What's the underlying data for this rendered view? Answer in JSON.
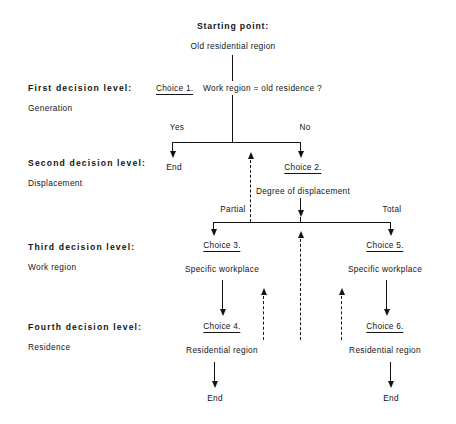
{
  "diagram": {
    "title_bold": "Starting  point:",
    "title_sub": "Old residential region",
    "levels": [
      {
        "title": "First decision level:",
        "sub": "Generation"
      },
      {
        "title": "Second decision level:",
        "sub": "Displacement"
      },
      {
        "title": "Third decision level:",
        "sub": "Work region"
      },
      {
        "title": "Fourth decision level:",
        "sub": "Residence"
      }
    ],
    "choices": {
      "c1_label": "Choice 1.",
      "c1_text": "Work region = old residence ?",
      "c2_label": "Choice 2.",
      "c2_text": "Degree of displacement",
      "c3_label": "Choice 3.",
      "c3_text": "Specific workplace",
      "c4_label": "Choice 4.",
      "c4_text": "Residential region",
      "c5_label": "Choice 5.",
      "c5_text": "Specific workplace",
      "c6_label": "Choice 6.",
      "c6_text": "Residential region"
    },
    "edges": {
      "yes": "Yes",
      "no": "No",
      "partial": "Partial",
      "total": "Total"
    },
    "terminals": {
      "end_yes": "End",
      "end_left": "End",
      "end_right": "End"
    }
  }
}
